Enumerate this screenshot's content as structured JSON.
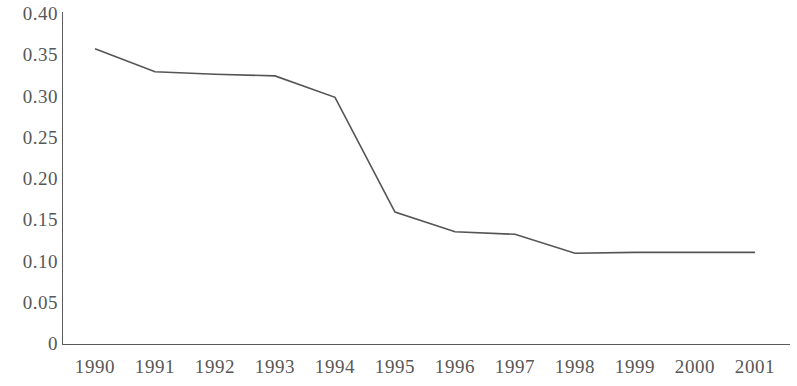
{
  "chart_data": {
    "type": "line",
    "title": "",
    "subtitle": "",
    "xlabel": "",
    "ylabel": "",
    "categories": [
      "1990",
      "1991",
      "1992",
      "1993",
      "1994",
      "1995",
      "1996",
      "1997",
      "1998",
      "1999",
      "2000",
      "2001"
    ],
    "series": [
      {
        "name": "",
        "values": [
          0.358,
          0.33,
          0.327,
          0.325,
          0.299,
          0.16,
          0.136,
          0.133,
          0.11,
          0.111,
          0.111,
          0.111
        ]
      }
    ],
    "x_tick_labels": [
      "1990",
      "1991",
      "1992",
      "1993",
      "1994",
      "1995",
      "1996",
      "1997",
      "1998",
      "1999",
      "2000",
      "2001"
    ],
    "y_tick_labels": [
      "0.40",
      "0.35",
      "0.30",
      "0.25",
      "0.20",
      "0.15",
      "0.10",
      "0.05",
      "0"
    ],
    "y_tick_values": [
      0.4,
      0.35,
      0.3,
      0.25,
      0.2,
      0.15,
      0.1,
      0.05,
      0
    ],
    "ylim": [
      0,
      0.4
    ],
    "xlim": [
      "1990",
      "2001"
    ],
    "grid": false,
    "legend": false,
    "legend_position": "none",
    "annotations": [],
    "line_color": "#555555",
    "axis_color": "#5a5a5a",
    "text_color": "#575757",
    "background_color": "#ffffff"
  },
  "layout": {
    "plot_left_px": 62,
    "plot_baseline_px": 344,
    "plot_top_px": 14,
    "plot_right_px": 790,
    "first_point_x_px": 95,
    "point_spacing_px": 60
  }
}
